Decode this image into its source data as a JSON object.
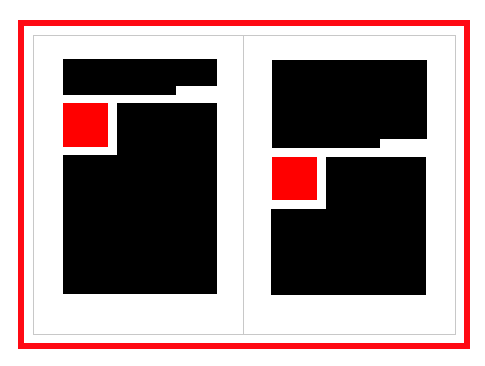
{
  "diagram": {
    "type": "two-page layout wireframe",
    "colors": {
      "frame": "#ff0a14",
      "block": "#000000",
      "accent": "#ff0000",
      "page_border": "#c8c8c8",
      "background": "#ffffff"
    },
    "pages": [
      {
        "name": "left-page",
        "blocks": [
          {
            "kind": "text-block",
            "shape": "header-with-notch"
          },
          {
            "kind": "image-placeholder",
            "color": "red"
          },
          {
            "kind": "text-block",
            "shape": "L-shaped body"
          }
        ]
      },
      {
        "name": "right-page",
        "blocks": [
          {
            "kind": "text-block",
            "shape": "large header-with-notch"
          },
          {
            "kind": "image-placeholder",
            "color": "red"
          },
          {
            "kind": "text-block",
            "shape": "L-shaped body"
          }
        ]
      }
    ]
  }
}
